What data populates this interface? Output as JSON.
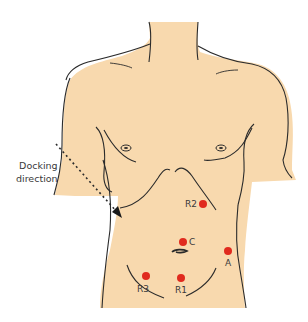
{
  "diagram": {
    "colors": {
      "skin": "#f8d9ae",
      "outline": "#2b2b2b",
      "port": "#e02a1e",
      "text": "#3a3a3a"
    },
    "annotation": {
      "line1": "Docking",
      "line2": "direction"
    },
    "ports": [
      {
        "id": "R2",
        "label": "R2",
        "x": 203,
        "y": 204
      },
      {
        "id": "C",
        "label": "C",
        "x": 183,
        "y": 242
      },
      {
        "id": "A",
        "label": "A",
        "x": 228,
        "y": 251
      },
      {
        "id": "R3",
        "label": "R3",
        "x": 146,
        "y": 276
      },
      {
        "id": "R1",
        "label": "R1",
        "x": 181,
        "y": 278
      }
    ]
  }
}
